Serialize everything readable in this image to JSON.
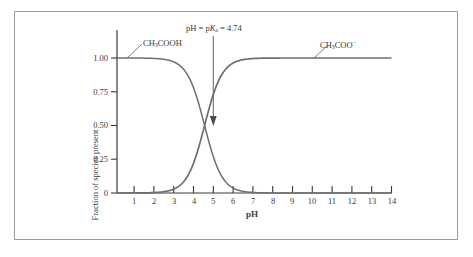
{
  "figure": {
    "ylabel": "Fraction of species present",
    "xlabel": "pH",
    "y_ticks": [
      "1.00",
      "0.75",
      "0.50",
      "0.25",
      "0"
    ],
    "x_ticks": [
      "1",
      "2",
      "3",
      "4",
      "5",
      "6",
      "7",
      "8",
      "9",
      "10",
      "11",
      "12",
      "13",
      "14"
    ],
    "annotations": {
      "acid_label_prefix": "CH",
      "acid_label_sub": "3",
      "acid_label_suffix": "COOH",
      "base_label_prefix": "CH",
      "base_label_sub": "3",
      "base_label_mid": "COO",
      "base_label_sup": "−",
      "pka_prefix": "pH = p",
      "pka_italic": "K",
      "pka_sub": "a",
      "pka_suffix": " = 4.74"
    },
    "colors": {
      "axis": "#3a3a3a",
      "curve": "#6e6e6e",
      "frame": "#9a9a9a",
      "text": "#3a3a3a",
      "background": "#ffffff"
    }
  },
  "chart_data": {
    "type": "line",
    "title": "",
    "xlabel": "pH",
    "ylabel": "Fraction of species present",
    "xlim": [
      0.4,
      14
    ],
    "ylim": [
      0,
      1.0
    ],
    "grid": false,
    "legend": "inline-annotations",
    "pKa": 4.74,
    "x": [
      0.4,
      1,
      1.5,
      2,
      2.5,
      3,
      3.25,
      3.5,
      3.75,
      4,
      4.25,
      4.5,
      4.74,
      5,
      5.25,
      5.5,
      5.75,
      6,
      6.25,
      6.5,
      7,
      7.5,
      8,
      9,
      10,
      11,
      12,
      13,
      14
    ],
    "series": [
      {
        "name": "CH3COOH",
        "label": "CH₃COOH",
        "values": [
          1.0,
          0.999,
          0.998,
          0.995,
          0.983,
          0.946,
          0.915,
          0.866,
          0.797,
          0.705,
          0.595,
          0.475,
          0.5,
          0.268,
          0.179,
          0.115,
          0.072,
          0.044,
          0.026,
          0.017,
          0.005,
          0.002,
          0.001,
          0.0,
          0.0,
          0.0,
          0.0,
          0.0,
          0.0
        ]
      },
      {
        "name": "CH3COO-",
        "label": "CH₃COO⁻",
        "values": [
          0.0,
          0.001,
          0.002,
          0.005,
          0.017,
          0.054,
          0.085,
          0.134,
          0.203,
          0.295,
          0.405,
          0.525,
          0.5,
          0.732,
          0.821,
          0.885,
          0.928,
          0.956,
          0.974,
          0.983,
          0.995,
          0.998,
          0.999,
          1.0,
          1.0,
          1.0,
          1.0,
          1.0,
          1.0
        ]
      }
    ],
    "annotations": [
      {
        "text": "pH = pKa = 4.74",
        "x": 4.74,
        "y": 0.5,
        "type": "arrow-down"
      },
      {
        "text": "CH3COOH",
        "x": 1.3,
        "y": 1.0,
        "type": "leader"
      },
      {
        "text": "CH3COO-",
        "x": 10.2,
        "y": 1.0,
        "type": "leader"
      }
    ]
  }
}
